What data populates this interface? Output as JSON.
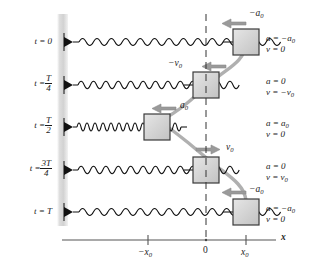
{
  "figure": {
    "axis": {
      "name": "x",
      "ticks": [
        {
          "label": "−x",
          "sub": "0",
          "x": 148
        },
        {
          "label": "0",
          "sub": "",
          "x": 206
        },
        {
          "label": "x",
          "sub": "0",
          "x": 246
        }
      ],
      "axis_label": "x"
    },
    "colors": {
      "ink": "#1a1a1a",
      "wall": "#d8d8d8",
      "mass_fill": "#d4d4d4",
      "mass_stroke": "#3a3a3a",
      "arrow": "#8c8c8c",
      "trajectory": "#a8a8a8",
      "background": "#ffffff"
    },
    "rows": [
      {
        "time_label": "t = 0",
        "time_lead": "t =",
        "time_value": "0",
        "time_is_fraction": false,
        "numerator": "",
        "denominator": "",
        "mass_position": "x0",
        "spring_state": "stretched",
        "arrow_label_main": "−a",
        "arrow_label_sub": "0",
        "arrow_direction": "left",
        "arrow_kind": "acceleration",
        "accel_text": "a = −a",
        "accel_sub": "0",
        "vel_text": "v = 0",
        "vel_sub": ""
      },
      {
        "time_label": "t = T/4",
        "time_lead": "t =",
        "time_value": "",
        "time_is_fraction": true,
        "numerator": "T",
        "denominator": "4",
        "mass_position": "0",
        "spring_state": "natural",
        "arrow_label_main": "−v",
        "arrow_label_sub": "0",
        "arrow_direction": "left",
        "arrow_kind": "velocity",
        "accel_text": "a = 0",
        "accel_sub": "",
        "vel_text": "v = −v",
        "vel_sub": "0"
      },
      {
        "time_label": "t = T/2",
        "time_lead": "t =",
        "time_value": "",
        "time_is_fraction": true,
        "numerator": "T",
        "denominator": "2",
        "mass_position": "-x0",
        "spring_state": "compressed",
        "arrow_label_main": "a",
        "arrow_label_sub": "0",
        "arrow_direction": "left",
        "arrow_kind": "acceleration",
        "accel_text": "a = a",
        "accel_sub": "0",
        "vel_text": "v = 0",
        "vel_sub": ""
      },
      {
        "time_label": "t = 3T/4",
        "time_lead": "t =",
        "time_value": "",
        "time_is_fraction": true,
        "numerator": "3T",
        "denominator": "4",
        "mass_position": "0",
        "spring_state": "natural",
        "arrow_label_main": "v",
        "arrow_label_sub": "0",
        "arrow_direction": "right",
        "arrow_kind": "velocity",
        "accel_text": "a = 0",
        "accel_sub": "",
        "vel_text": "v = v",
        "vel_sub": "0"
      },
      {
        "time_label": "t = T",
        "time_lead": "t =",
        "time_value": "T",
        "time_is_fraction": false,
        "numerator": "",
        "denominator": "",
        "mass_position": "x0",
        "spring_state": "stretched",
        "arrow_label_main": "−a",
        "arrow_label_sub": "0",
        "arrow_direction": "left",
        "arrow_kind": "acceleration",
        "accel_text": "a = −a",
        "accel_sub": "0",
        "vel_text": "v = 0",
        "vel_sub": ""
      }
    ]
  }
}
